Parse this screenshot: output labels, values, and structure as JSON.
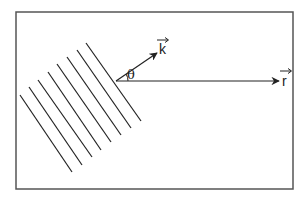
{
  "diagram": {
    "type": "wavefront-vector-diagram",
    "frame": {
      "x": 16,
      "y": 12,
      "width": 277,
      "height": 177,
      "stroke": "#555555"
    },
    "origin": {
      "x": 116,
      "y": 81
    },
    "wavefront_lines": [
      {
        "x1": 86,
        "y1": 43,
        "x2": 141,
        "y2": 121
      },
      {
        "x1": 77,
        "y1": 50,
        "x2": 131,
        "y2": 128
      },
      {
        "x1": 67,
        "y1": 57,
        "x2": 121,
        "y2": 135
      },
      {
        "x1": 57,
        "y1": 64,
        "x2": 111,
        "y2": 142
      },
      {
        "x1": 48,
        "y1": 72,
        "x2": 101,
        "y2": 150
      },
      {
        "x1": 38,
        "y1": 80,
        "x2": 92,
        "y2": 157
      },
      {
        "x1": 29,
        "y1": 87,
        "x2": 82,
        "y2": 165
      },
      {
        "x1": 20,
        "y1": 95,
        "x2": 72,
        "y2": 172
      }
    ],
    "vectors": [
      {
        "name": "k",
        "label": "k",
        "tip": {
          "x": 157,
          "y": 53
        },
        "label_pos": {
          "x": 158,
          "y": 54
        }
      },
      {
        "name": "r",
        "label": "r",
        "tip": {
          "x": 279,
          "y": 81
        },
        "label_pos": {
          "x": 282,
          "y": 86
        }
      }
    ],
    "angle": {
      "label": "θ",
      "label_pos": {
        "x": 127,
        "y": 79
      }
    },
    "line_color": "#222222"
  }
}
